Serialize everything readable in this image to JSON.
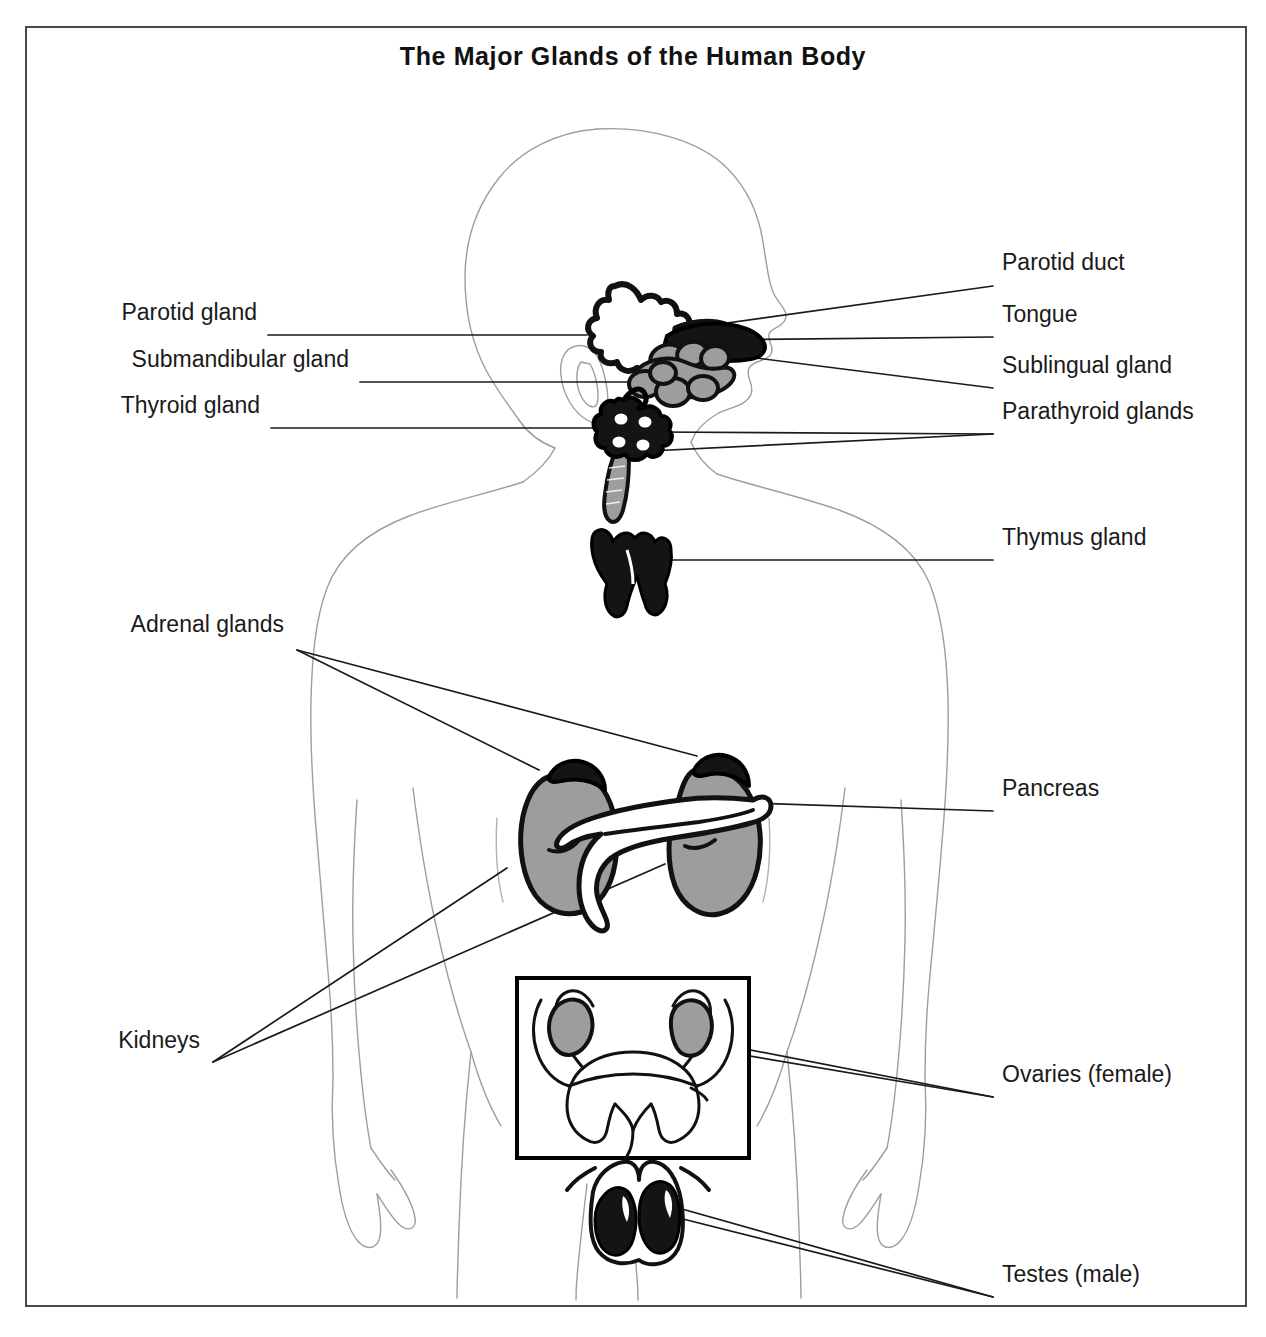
{
  "document": {
    "title": "The Major Glands of the Human Body",
    "type": "anatomical-diagram",
    "border_color": "#4a4a4a",
    "background_color": "#ffffff"
  },
  "colors": {
    "text": "#1a1a1a",
    "leader_line": "#1a1a1a",
    "body_outline": "#9a9a9a",
    "organ_outline": "#000000",
    "organ_dark": "#111111",
    "organ_gray": "#9d9d9d",
    "organ_white": "#ffffff",
    "inset_box": "#000000"
  },
  "labels": {
    "left": [
      {
        "id": "parotid-gland",
        "text": "Parotid gland",
        "x": 230,
        "y": 313
      },
      {
        "id": "submandibular-gland",
        "text": "Submandibular gland",
        "x": 322,
        "y": 360
      },
      {
        "id": "thyroid-gland",
        "text": "Thyroid gland",
        "x": 233,
        "y": 406
      },
      {
        "id": "adrenal-glands",
        "text": "Adrenal glands",
        "x": 257,
        "y": 625
      },
      {
        "id": "kidneys",
        "text": "Kidneys",
        "x": 173,
        "y": 1041
      }
    ],
    "right": [
      {
        "id": "parotid-duct",
        "text": "Parotid duct",
        "x": 975,
        "y": 263
      },
      {
        "id": "tongue",
        "text": "Tongue",
        "x": 975,
        "y": 315
      },
      {
        "id": "sublingual-gland",
        "text": "Sublingual gland",
        "x": 975,
        "y": 366
      },
      {
        "id": "parathyroid-glands",
        "text": "Parathyroid glands",
        "x": 975,
        "y": 412
      },
      {
        "id": "thymus-gland",
        "text": "Thymus gland",
        "x": 975,
        "y": 538
      },
      {
        "id": "pancreas",
        "text": "Pancreas",
        "x": 975,
        "y": 789
      },
      {
        "id": "ovaries-female",
        "text": "Ovaries (female)",
        "x": 975,
        "y": 1075
      },
      {
        "id": "testes-male",
        "text": "Testes (male)",
        "x": 975,
        "y": 1275
      }
    ]
  },
  "organs": [
    {
      "id": "parotid-gland",
      "fill": "white",
      "note": "outlined lobed gland anterior to ear"
    },
    {
      "id": "parotid-duct",
      "fill": "white",
      "note": "duct running forward from parotid gland"
    },
    {
      "id": "tongue",
      "fill": "dark",
      "note": "solid dark tongue in oral cavity"
    },
    {
      "id": "sublingual-gland",
      "fill": "gray",
      "note": "gray gland under tongue"
    },
    {
      "id": "submandibular-gland",
      "fill": "gray",
      "note": "gray gland below mandible"
    },
    {
      "id": "thyroid-gland",
      "fill": "dark",
      "note": "dark butterfly gland over trachea"
    },
    {
      "id": "parathyroid-glands",
      "fill": "white",
      "note": "four light dots on thyroid"
    },
    {
      "id": "trachea",
      "fill": "gray",
      "note": "gray tube below thyroid"
    },
    {
      "id": "thymus-gland",
      "fill": "dark",
      "note": "dark bilobed gland in mediastinum"
    },
    {
      "id": "kidney-left",
      "fill": "gray",
      "note": "gray bean shaped kidney"
    },
    {
      "id": "kidney-right",
      "fill": "gray",
      "note": "gray bean shaped kidney"
    },
    {
      "id": "adrenal-gland-left",
      "fill": "dark",
      "note": "dark cap on superior pole of kidney"
    },
    {
      "id": "adrenal-gland-right",
      "fill": "dark",
      "note": "dark cap on superior pole of kidney"
    },
    {
      "id": "pancreas",
      "fill": "white",
      "note": "white elongated organ across kidneys"
    },
    {
      "id": "uterus",
      "fill": "white",
      "note": "uterus outline inside inset box"
    },
    {
      "id": "ovary-left",
      "fill": "gray",
      "note": "gray ovary on uterine tube"
    },
    {
      "id": "ovary-right",
      "fill": "gray",
      "note": "gray ovary on uterine tube"
    },
    {
      "id": "testis-left",
      "fill": "dark",
      "note": "dark testis inside scrotum"
    },
    {
      "id": "testis-right",
      "fill": "dark",
      "note": "dark testis inside scrotum"
    }
  ],
  "inset": {
    "id": "female-reproductive-inset",
    "x": 490,
    "y": 950,
    "width": 232,
    "height": 180,
    "contents": "uterus with ovaries"
  },
  "figure_body": {
    "id": "human-body-silhouette",
    "orientation": "anterior view with head in right profile",
    "line_style": "thin dotted gray outline"
  }
}
